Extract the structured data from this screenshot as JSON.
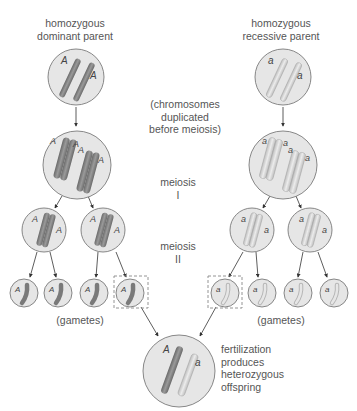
{
  "labels": {
    "dominant_parent": [
      "homozygous",
      "dominant parent"
    ],
    "recessive_parent": [
      "homozygous",
      "recessive parent"
    ],
    "duplication_note": [
      "(chromosomes",
      "duplicated",
      "before meiosis)"
    ],
    "meiosis_1": [
      "meiosis",
      "I"
    ],
    "meiosis_2": [
      "meiosis",
      "II"
    ],
    "gametes_left": "(gametes)",
    "gametes_right": "(gametes)",
    "fertilization": [
      "fertilization",
      "produces",
      "heterozygous",
      "offspring"
    ]
  },
  "alleles": {
    "dominant": "A",
    "recessive": "a"
  },
  "colors": {
    "cell_fill": "#e6e6e6",
    "cell_stroke": "#7a7a7a",
    "dominant_chromosome": "#8a8a8a",
    "recessive_chromosome": "#d4d4d4",
    "text": "#555555"
  }
}
